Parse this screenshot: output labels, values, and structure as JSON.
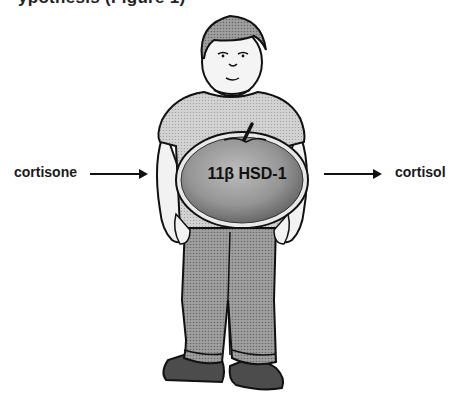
{
  "header": {
    "clipped_title": "ypothesis (Figure 1)"
  },
  "diagram": {
    "input_label": "cortisone",
    "enzyme_label": "11β HSD-1",
    "output_label": "cortisol",
    "figure_description": "cartoon of an overweight boy with an apple-shaped belly"
  },
  "colors": {
    "shirt": "#c8c8c8",
    "pants": "#9a9a9a",
    "shoes": "#4a4a4a",
    "hair": "#7a7a7a",
    "apple": "#8c8c8c",
    "outline": "#111111"
  }
}
